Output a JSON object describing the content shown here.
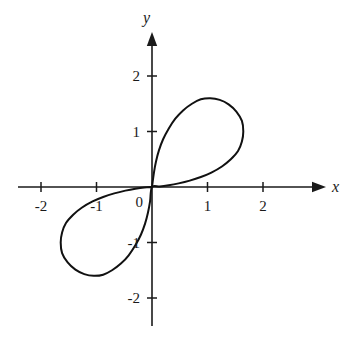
{
  "figure": {
    "background_color": "#ffffff",
    "curve_color": "#111111",
    "axis_color": "#1a1a1a",
    "width": 348,
    "height": 340
  },
  "axes": {
    "x_label": "x",
    "y_label": "y",
    "origin_label": "0",
    "x_ticks": [
      {
        "value": -2,
        "label": "-2"
      },
      {
        "value": -1,
        "label": "-1"
      },
      {
        "value": 1,
        "label": "1"
      },
      {
        "value": 2,
        "label": "2"
      }
    ],
    "y_ticks": [
      {
        "value": 2,
        "label": "2"
      },
      {
        "value": 1,
        "label": "1"
      },
      {
        "value": -1,
        "label": "-1"
      },
      {
        "value": -2,
        "label": "-2"
      }
    ]
  },
  "chart_data": {
    "type": "line",
    "title": "",
    "subtitle": "",
    "xlabel": "x",
    "ylabel": "y",
    "xlim": [
      -2.45,
      3.45
    ],
    "ylim": [
      -2.45,
      2.8
    ],
    "grid": false,
    "legend": null,
    "annotations": [],
    "x_tick_values": [
      -2,
      -1,
      1,
      2
    ],
    "x_tick_labels": [
      "-2",
      "-1",
      "1",
      "2"
    ],
    "y_tick_values": [
      2,
      1,
      -1,
      -2
    ],
    "y_tick_labels": [
      "2",
      "1",
      "-1",
      "-2"
    ],
    "series": [
      {
        "name": "curve",
        "closed": true,
        "points": [
          [
            0.0,
            0.0
          ],
          [
            0.035,
            0.26
          ],
          [
            0.072,
            0.46
          ],
          [
            0.125,
            0.66
          ],
          [
            0.2,
            0.86
          ],
          [
            0.3,
            1.05
          ],
          [
            0.42,
            1.23
          ],
          [
            0.56,
            1.38
          ],
          [
            0.72,
            1.5
          ],
          [
            0.88,
            1.58
          ],
          [
            1.05,
            1.6
          ],
          [
            1.22,
            1.57
          ],
          [
            1.38,
            1.49
          ],
          [
            1.52,
            1.36
          ],
          [
            1.62,
            1.19
          ],
          [
            1.645,
            1.0
          ],
          [
            1.62,
            0.82
          ],
          [
            1.55,
            0.65
          ],
          [
            1.42,
            0.5
          ],
          [
            1.26,
            0.37
          ],
          [
            1.07,
            0.26
          ],
          [
            0.88,
            0.18
          ],
          [
            0.68,
            0.115
          ],
          [
            0.48,
            0.065
          ],
          [
            0.3,
            0.03
          ],
          [
            0.14,
            0.008
          ],
          [
            0.0,
            0.0
          ],
          [
            -0.035,
            -0.26
          ],
          [
            -0.072,
            -0.46
          ],
          [
            -0.125,
            -0.66
          ],
          [
            -0.2,
            -0.86
          ],
          [
            -0.3,
            -1.05
          ],
          [
            -0.42,
            -1.23
          ],
          [
            -0.56,
            -1.38
          ],
          [
            -0.72,
            -1.5
          ],
          [
            -0.88,
            -1.58
          ],
          [
            -1.05,
            -1.6
          ],
          [
            -1.22,
            -1.57
          ],
          [
            -1.38,
            -1.49
          ],
          [
            -1.52,
            -1.36
          ],
          [
            -1.62,
            -1.19
          ],
          [
            -1.645,
            -1.0
          ],
          [
            -1.62,
            -0.82
          ],
          [
            -1.55,
            -0.65
          ],
          [
            -1.42,
            -0.5
          ],
          [
            -1.26,
            -0.37
          ],
          [
            -1.07,
            -0.26
          ],
          [
            -0.88,
            -0.18
          ],
          [
            -0.68,
            -0.115
          ],
          [
            -0.48,
            -0.065
          ],
          [
            -0.3,
            -0.03
          ],
          [
            -0.14,
            -0.008
          ],
          [
            0.0,
            0.0
          ]
        ]
      }
    ]
  }
}
